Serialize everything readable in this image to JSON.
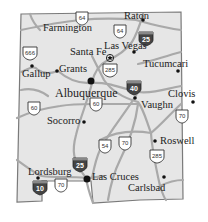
{
  "map": {
    "title": "New Mexico",
    "colors": {
      "state_fill": "#e6e6e6",
      "border": "#777777",
      "road": "#a9a9a9",
      "city_dot": "#111111",
      "interstate": "#444444"
    },
    "cities": [
      {
        "name": "Farmington",
        "x": 44,
        "y": 27
      },
      {
        "name": "Raton",
        "x": 124,
        "y": 15
      },
      {
        "name": "Santa Fe",
        "x": 70,
        "y": 54
      },
      {
        "name": "Las Vegas",
        "x": 104,
        "y": 44
      },
      {
        "name": "Gallup",
        "x": 18,
        "y": 72
      },
      {
        "name": "Grants",
        "x": 58,
        "y": 64
      },
      {
        "name": "Tucumcari",
        "x": 140,
        "y": 60
      },
      {
        "name": "Albuquerque",
        "x": 56,
        "y": 86
      },
      {
        "name": "Clovis",
        "x": 168,
        "y": 90
      },
      {
        "name": "Vaughn",
        "x": 143,
        "y": 104
      },
      {
        "name": "Socorro",
        "x": 48,
        "y": 122
      },
      {
        "name": "Roswell",
        "x": 159,
        "y": 136
      },
      {
        "name": "Lordsburg",
        "x": 28,
        "y": 168
      },
      {
        "name": "Las Cruces",
        "x": 91,
        "y": 179
      },
      {
        "name": "Carlsbad",
        "x": 128,
        "y": 184
      }
    ],
    "us_routes": [
      "64",
      "64",
      "666",
      "285",
      "60",
      "60",
      "54",
      "70",
      "70",
      "285",
      "70"
    ],
    "interstates": [
      "25",
      "40",
      "25",
      "10"
    ],
    "capital_marker": "star-icon"
  }
}
